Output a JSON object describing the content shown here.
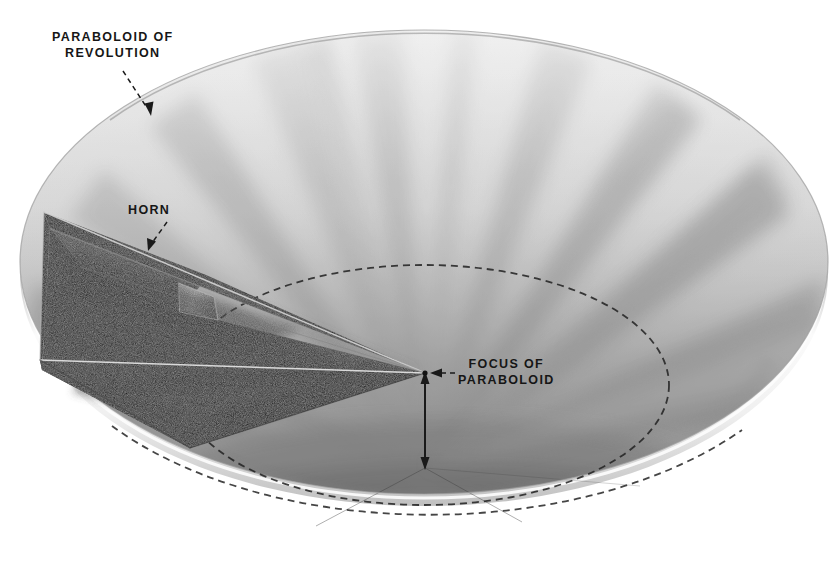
{
  "figure": {
    "width": 839,
    "height": 573,
    "background_color": "#ffffff"
  },
  "labels": {
    "paraboloid": {
      "line1": "PARABOLOID OF",
      "line2": "REVOLUTION",
      "text": "PARABOLOID OF\nREVOLUTION"
    },
    "horn": {
      "text": "HORN"
    },
    "focus": {
      "line1": "FOCUS OF",
      "line2": "PARABOLOID",
      "text": "FOCUS OF\nPARABOLOID"
    }
  },
  "colors": {
    "ink": "#161616",
    "dish_light": "#fcfcfc",
    "dish_gore_gray": "#d7d7d7",
    "dish_gore_gray_dark": "#bdbdbd",
    "dish_shadow": "#9a9a9a",
    "dish_rim_edge": "#8f8f8f",
    "horn_dark": "#1c1c1c",
    "horn_mid": "#3a3a3a",
    "horn_light_facet": "#9c9c9c",
    "horn_edge_highlight": "#e8e8e8",
    "dashed_line": "#2a2a2a"
  },
  "geometry": {
    "dish_center_x": 424,
    "dish_center_y": 262,
    "dish_vertex_x": 425,
    "dish_vertex_y": 468,
    "focus_x": 425,
    "focus_y": 373,
    "focal_depth_px": 95,
    "rim_radius_x": 404,
    "rim_radius_y": 232,
    "dashed_circle_radius_x": 245,
    "dashed_circle_radius_y": 120,
    "dashed_circle_center_y": 385,
    "gore_count": 16
  },
  "elements": {
    "dish": "paraboloid-reflector-dish",
    "horn": "pyramidal-feed-horn",
    "focus_marker": "focus-point",
    "focal_length_arrow": "focal-length-double-arrow",
    "dashed_focal_circle": "dashed-focal-plane-circle"
  }
}
